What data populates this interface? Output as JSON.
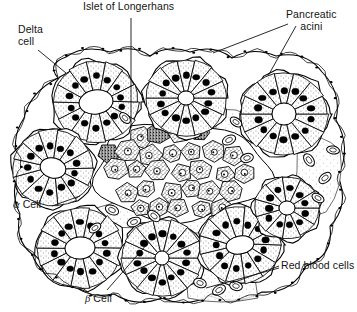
{
  "figure": {
    "kind": "histology-line-drawing",
    "background_color": "#ffffff",
    "ink_color": "#000000",
    "width": 357,
    "height": 312
  },
  "labels": {
    "delta_cell": "Delta\ncell",
    "islet": "Islet of Longerhans",
    "pancreatic_acini": "Pancreatic\nacini",
    "alpha_cell_symbol": "α",
    "alpha_cell": " Cell",
    "beta_cell_symbol": "β",
    "beta_cell": " Cell",
    "red_blood_cells": "Red blood cells"
  },
  "structures": {
    "acini": [
      {
        "name": "acinus-top-left",
        "cx": 96,
        "cy": 102,
        "r": 44,
        "lumen_rx": 17,
        "lumen_ry": 12,
        "lumen_rot": -8,
        "cells": 14,
        "lumen": "open"
      },
      {
        "name": "acinus-top-center",
        "cx": 186,
        "cy": 98,
        "r": 42,
        "lumen_rx": 8,
        "lumen_ry": 7,
        "lumen_rot": 0,
        "cells": 14,
        "lumen": "small"
      },
      {
        "name": "acinus-top-right",
        "cx": 284,
        "cy": 114,
        "r": 45,
        "lumen_rx": 12,
        "lumen_ry": 11,
        "lumen_rot": 0,
        "cells": 14,
        "lumen": "open"
      },
      {
        "name": "acinus-mid-left",
        "cx": 53,
        "cy": 168,
        "r": 42,
        "lumen_rx": 13,
        "lumen_ry": 10,
        "lumen_rot": 15,
        "cells": 13,
        "lumen": "open"
      },
      {
        "name": "acinus-bottom-left",
        "cx": 80,
        "cy": 248,
        "r": 44,
        "lumen_rx": 15,
        "lumen_ry": 11,
        "lumen_rot": -5,
        "cells": 14,
        "lumen": "open"
      },
      {
        "name": "acinus-bottom-center",
        "cx": 162,
        "cy": 258,
        "r": 42,
        "lumen_rx": 7,
        "lumen_ry": 7,
        "lumen_rot": 0,
        "cells": 14,
        "lumen": "small"
      },
      {
        "name": "acinus-bottom-right",
        "cx": 240,
        "cy": 245,
        "r": 42,
        "lumen_rx": 14,
        "lumen_ry": 9,
        "lumen_rot": -10,
        "cells": 13,
        "lumen": "open"
      },
      {
        "name": "acinus-right",
        "cx": 287,
        "cy": 208,
        "r": 34,
        "lumen_rx": 8,
        "lumen_ry": 7,
        "lumen_rot": 0,
        "cells": 11,
        "lumen": "small"
      }
    ],
    "islet": {
      "name": "islet-of-langerhans",
      "cx": 180,
      "cy": 172,
      "rx": 88,
      "ry": 48,
      "beta_cell_count": 26,
      "alpha_cell_count": 3,
      "note": "polygonal pale-stippled beta cells with ring nuclei; dark heavily-granulated alpha/delta cells at margins"
    },
    "red_blood_cells": [
      {
        "cx": 112,
        "cy": 210,
        "rx": 7,
        "ry": 4.5,
        "rot": 25
      },
      {
        "cx": 134,
        "cy": 222,
        "rx": 7,
        "ry": 4.5,
        "rot": -20
      },
      {
        "cx": 154,
        "cy": 216,
        "rx": 7,
        "ry": 4.5,
        "rot": 40
      },
      {
        "cx": 95,
        "cy": 228,
        "rx": 6.5,
        "ry": 4,
        "rot": -35
      },
      {
        "cx": 200,
        "cy": 283,
        "rx": 6.5,
        "ry": 4.5,
        "rot": 20
      },
      {
        "cx": 219,
        "cy": 290,
        "rx": 7,
        "ry": 4.5,
        "rot": -30
      },
      {
        "cx": 236,
        "cy": 286,
        "rx": 6.5,
        "ry": 4.5,
        "rot": 15
      },
      {
        "cx": 309,
        "cy": 160,
        "rx": 7,
        "ry": 4.5,
        "rot": 55
      },
      {
        "cx": 325,
        "cy": 178,
        "rx": 7,
        "ry": 4.5,
        "rot": -40
      },
      {
        "cx": 318,
        "cy": 198,
        "rx": 6.5,
        "ry": 4,
        "rot": 30
      },
      {
        "cx": 333,
        "cy": 150,
        "rx": 6.5,
        "ry": 4,
        "rot": 10
      },
      {
        "cx": 229,
        "cy": 140,
        "rx": 7,
        "ry": 4.5,
        "rot": -25
      },
      {
        "cx": 236,
        "cy": 122,
        "rx": 6.5,
        "ry": 4,
        "rot": 35
      },
      {
        "cx": 247,
        "cy": 158,
        "rx": 6.5,
        "ry": 4.5,
        "rot": -15
      },
      {
        "cx": 125,
        "cy": 118,
        "rx": 6.5,
        "ry": 4,
        "rot": 45
      }
    ],
    "leader_lines": [
      {
        "name": "leader-delta-cell",
        "points": "38,50 66,73"
      },
      {
        "name": "leader-islet",
        "points": "131,18 131,128"
      },
      {
        "name": "leader-acini-a",
        "points": "288,24 213,53"
      },
      {
        "name": "leader-acini-b",
        "points": "296,26 268,76"
      },
      {
        "name": "leader-alpha-cell",
        "points": "52,206 80,196"
      },
      {
        "name": "leader-beta-cell",
        "points": "107,290 148,243"
      },
      {
        "name": "leader-rbc-a",
        "points": "279,266 232,283"
      },
      {
        "name": "leader-rbc-b",
        "points": "279,268 206,288"
      }
    ]
  }
}
